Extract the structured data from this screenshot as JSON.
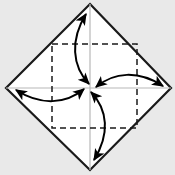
{
  "figure": {
    "name": "origami-fold-diagram",
    "canvas": {
      "width": 175,
      "height": 175
    },
    "colors": {
      "background": "#e9e9e9",
      "sheet_fill": "#ffffff",
      "sheet_outline": "#1a1a1a",
      "dashed_line": "#1a1a1a",
      "guide_line": "#b8b8b8",
      "arrow": "#000000",
      "watermark": "#e2e2e2"
    },
    "outline": {
      "label": "paper-outline",
      "shape": "diamond",
      "stroke_width": 2.2,
      "vertices": [
        {
          "name": "top",
          "x": 90,
          "y": 4
        },
        {
          "name": "right",
          "x": 171,
          "y": 88
        },
        {
          "name": "bottom",
          "x": 90,
          "y": 170
        },
        {
          "name": "left",
          "x": 6,
          "y": 88
        }
      ]
    },
    "dashed_square": {
      "label": "inner-crease-square",
      "left": 52,
      "top": 44,
      "right": 137,
      "bottom": 128,
      "stroke_width": 1.5,
      "dash_pattern": "6,4"
    },
    "guides": {
      "label": "center-guide-lines",
      "stroke_width": 1.2,
      "center": {
        "x": 90,
        "y": 88
      },
      "horizontal": {
        "x1": 6,
        "y1": 88,
        "x2": 171,
        "y2": 88
      },
      "vertical": {
        "x1": 90,
        "y1": 4,
        "x2": 90,
        "y2": 170
      }
    },
    "arrows": [
      {
        "name": "arrow-top-to-center",
        "from": "top-vertex",
        "to": "center",
        "double_headed": true,
        "path": "M 86 14 C 70 40, 72 66, 89 84",
        "head_at_start": true,
        "head_at_end": true
      },
      {
        "name": "arrow-right-to-center",
        "from": "right-vertex",
        "to": "center",
        "double_headed": true,
        "path": "M 163 86 C 138 70, 114 72, 96 87",
        "head_at_start": true,
        "head_at_end": true
      },
      {
        "name": "arrow-bottom-to-center",
        "from": "bottom-vertex",
        "to": "center",
        "double_headed": true,
        "path": "M 94 160 C 110 134, 108 110, 91 92",
        "head_at_start": true,
        "head_at_end": true
      },
      {
        "name": "arrow-left-to-center",
        "from": "left-vertex",
        "to": "center",
        "double_headed": true,
        "path": "M 16 90 C 41 106, 66 104, 84 89",
        "head_at_start": true,
        "head_at_end": true
      }
    ],
    "watermark": {
      "label": "faint-caption",
      "text": "",
      "visible": false
    }
  }
}
